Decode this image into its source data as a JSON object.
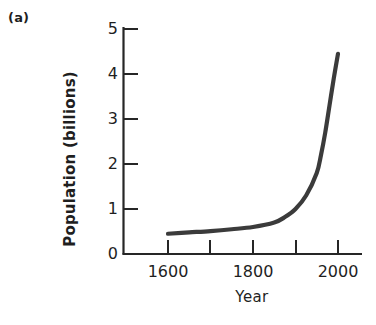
{
  "figure": {
    "panel_label": "(a)",
    "background_color": "#ffffff",
    "axis_color": "#262626",
    "curve_color": "#3b3b3b"
  },
  "chart_data": {
    "type": "line",
    "title": "",
    "subtitle": "",
    "panel": "(a)",
    "xlabel": "Year",
    "ylabel": "Population (billions)",
    "xlim": [
      1550,
      2050
    ],
    "ylim": [
      0,
      5
    ],
    "grid": false,
    "legend": null,
    "xticks": [
      1600,
      1700,
      1800,
      1900,
      2000
    ],
    "xtick_labels": [
      "1600",
      "",
      "1800",
      "",
      "2000"
    ],
    "xtick_labels_shown": [
      "1600",
      "1800",
      "2000"
    ],
    "yticks": [
      0,
      1,
      2,
      3,
      4,
      5
    ],
    "ytick_labels": [
      "0",
      "1",
      "2",
      "3",
      "4",
      "5"
    ],
    "tick_direction": "in",
    "series": [
      {
        "name": "World population",
        "x": [
          1600,
          1650,
          1700,
          1750,
          1800,
          1850,
          1875,
          1900,
          1925,
          1950,
          1960,
          1970,
          1980,
          1990,
          2000
        ],
        "values": [
          0.45,
          0.48,
          0.51,
          0.55,
          0.6,
          0.7,
          0.82,
          1.0,
          1.3,
          1.8,
          2.2,
          2.7,
          3.3,
          3.9,
          4.45
        ]
      }
    ],
    "annotations": []
  }
}
